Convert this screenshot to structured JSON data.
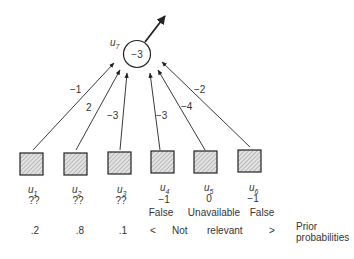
{
  "output_unit": {
    "name": "u",
    "sub": "7",
    "bias": "−3"
  },
  "input_units": [
    {
      "name": "u",
      "sub": "1",
      "value": "??",
      "state": "",
      "prior": ".2",
      "weight": "−1"
    },
    {
      "name": "u",
      "sub": "2",
      "value": "??",
      "state": "",
      "prior": ".8",
      "weight": "2"
    },
    {
      "name": "u",
      "sub": "3",
      "value": "??",
      "state": "",
      "prior": ".1",
      "weight": "−3"
    },
    {
      "name": "u",
      "sub": "4",
      "value": "−1",
      "state": "False",
      "prior": "",
      "weight": "−3"
    },
    {
      "name": "u",
      "sub": "5",
      "value": "0",
      "state": "Unavailable",
      "prior": "",
      "weight": "−4"
    },
    {
      "name": "u",
      "sub": "6",
      "value": "−1",
      "state": "False",
      "prior": "",
      "weight": "−2"
    }
  ],
  "not_relevant": {
    "open": "<",
    "word1": "Not",
    "word2": "relevant",
    "close": ">"
  },
  "prior_label": {
    "line1": "Prior",
    "line2": "probabilities"
  }
}
